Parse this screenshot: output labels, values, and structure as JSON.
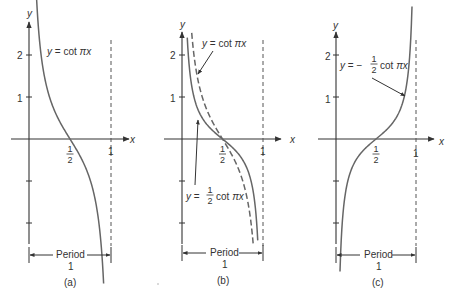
{
  "figure": {
    "colors": {
      "axis": "#333333",
      "curve": "#666666",
      "asymptote": "#555555",
      "text": "#333333"
    },
    "panels": [
      {
        "id": "a",
        "caption": "(a)",
        "origin": [
          29,
          139
        ],
        "xscale": 82,
        "yscale": 42,
        "axis_labels": {
          "x": "x",
          "y": "y"
        },
        "y_ticks": [
          {
            "value": 2,
            "label": "2"
          },
          {
            "value": 1,
            "label": "1"
          },
          {
            "value": -1,
            "label": ""
          },
          {
            "value": -2,
            "label": ""
          }
        ],
        "x_ticks": [
          {
            "value": 0.5,
            "label": "1/2"
          },
          {
            "value": 1,
            "label": "1"
          }
        ],
        "period_label": "Period",
        "period_value": "1",
        "curves": [
          {
            "name": "cot",
            "formula": "y = cot πx",
            "coef": 1,
            "style": "solid",
            "x_range": [
              0.08,
              0.91
            ]
          }
        ],
        "annotations": [
          {
            "text": "y = cot πx",
            "pos": [
              48,
              57
            ]
          }
        ]
      },
      {
        "id": "b",
        "caption": "(b)",
        "origin": [
          182,
          139
        ],
        "xscale": 81,
        "yscale": 42,
        "axis_labels": {
          "x": "x",
          "y": "y"
        },
        "y_ticks": [
          {
            "value": 2,
            "label": "2"
          },
          {
            "value": 1,
            "label": "1"
          },
          {
            "value": -1,
            "label": ""
          },
          {
            "value": -2,
            "label": ""
          }
        ],
        "x_ticks": [
          {
            "value": 0.5,
            "label": "1/2"
          },
          {
            "value": 1,
            "label": "1"
          }
        ],
        "period_label": "Period",
        "period_value": "1",
        "curves": [
          {
            "name": "cot",
            "formula": "y = cot πx",
            "coef": 1,
            "style": "dashed",
            "x_range": [
              0.12,
              0.88
            ]
          },
          {
            "name": "half-cot",
            "formula": "y = ½ cot πx",
            "coef": 0.5,
            "style": "solid",
            "x_range": [
              0.065,
              0.935
            ]
          }
        ],
        "annotations": [
          {
            "text": "y = cot πx",
            "pos": [
              204,
              48
            ]
          },
          {
            "text": "y = ½ cot πx",
            "pos": [
              186,
              200
            ]
          }
        ]
      },
      {
        "id": "c",
        "caption": "(c)",
        "origin": [
          336,
          139
        ],
        "xscale": 80,
        "yscale": 42,
        "axis_labels": {
          "x": "x",
          "y": "y"
        },
        "y_ticks": [
          {
            "value": 2,
            "label": "2"
          },
          {
            "value": 1,
            "label": "1"
          },
          {
            "value": -1,
            "label": ""
          },
          {
            "value": -2,
            "label": ""
          }
        ],
        "x_ticks": [
          {
            "value": 0.5,
            "label": "1/2"
          },
          {
            "value": 1,
            "label": "1"
          }
        ],
        "period_label": "Period",
        "period_value": "1",
        "curves": [
          {
            "name": "neg-half-cot",
            "formula": "y = −½ cot πx",
            "coef": -0.5,
            "style": "solid",
            "x_range": [
              0.05,
              0.95
            ]
          }
        ],
        "annotations": [
          {
            "text": "y = −½ cot πx",
            "pos": [
              340,
              68
            ]
          }
        ]
      }
    ]
  }
}
